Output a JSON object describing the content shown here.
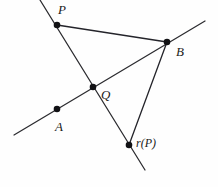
{
  "figure": {
    "width": 218,
    "height": 187,
    "background_color": "#fefefe",
    "stroke_color": "#2b2b2f",
    "point_color": "#111114"
  },
  "labels": {
    "p": "P",
    "b": "B",
    "q": "Q",
    "a": "A",
    "rp": "r(P)"
  },
  "points": [
    {
      "name": "P",
      "x": 57,
      "y": 25,
      "label_x": 58,
      "label_y": 3
    },
    {
      "name": "B",
      "x": 167,
      "y": 42,
      "label_x": 176,
      "label_y": 45
    },
    {
      "name": "Q",
      "x": 93,
      "y": 87,
      "label_x": 101,
      "label_y": 88
    },
    {
      "name": "A",
      "x": 57,
      "y": 109,
      "label_x": 55,
      "label_y": 120
    },
    {
      "name": "r(P)",
      "x": 129,
      "y": 145,
      "label_x": 136,
      "label_y": 137
    }
  ],
  "lines": [
    {
      "name": "mirror-line-A-B",
      "x1": 14,
      "y1": 135,
      "x2": 205,
      "y2": 21
    },
    {
      "name": "line-P-rP",
      "x1": 40,
      "y1": 0,
      "x2": 145,
      "y2": 170
    }
  ],
  "segments": [
    {
      "name": "segment-P-B",
      "x1": 57,
      "y1": 25,
      "x2": 167,
      "y2": 42
    },
    {
      "name": "segment-B-rP",
      "x1": 167,
      "y1": 42,
      "x2": 129,
      "y2": 145
    }
  ]
}
